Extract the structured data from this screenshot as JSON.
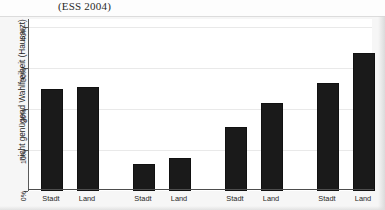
{
  "caption": {
    "text": "(ESS 2004)"
  },
  "chart_data": {
    "type": "bar",
    "title": "(ESS 2004)",
    "xlabel": "",
    "ylabel": "nicht genügend Wahlfreiheit (Hausarzt)",
    "categories": [
      "Stadt",
      "Land",
      "Stadt",
      "Land",
      "Stadt",
      "Land",
      "Stadt",
      "Land"
    ],
    "values": [
      24.8,
      25.4,
      6.6,
      8.0,
      15.6,
      21.4,
      26.3,
      33.8
    ],
    "ylim": [
      0,
      42
    ],
    "ytick_values": [
      0,
      10,
      20,
      30,
      40
    ],
    "ytick_labels": [
      "0%",
      "10%",
      "20%",
      "30%",
      "40%"
    ],
    "grid": true,
    "legend": "none",
    "bar_color": "#1a1a1a",
    "groups": 4,
    "bars_per_group": 2
  },
  "axis": {
    "y_title": "nicht genügend Wahlfreiheit (Hausarzt)",
    "ticks": [
      {
        "label": "40%",
        "value": 40
      },
      {
        "label": "30%",
        "value": 30
      },
      {
        "label": "20%",
        "value": 20
      },
      {
        "label": "10%",
        "value": 10
      },
      {
        "label": "0%",
        "value": 0
      }
    ]
  },
  "bars": [
    {
      "label": "Stadt",
      "value": 24.8
    },
    {
      "label": "Land",
      "value": 25.4
    },
    {
      "label": "Stadt",
      "value": 6.6
    },
    {
      "label": "Land",
      "value": 8.0
    },
    {
      "label": "Stadt",
      "value": 15.6
    },
    {
      "label": "Land",
      "value": 21.4
    },
    {
      "label": "Stadt",
      "value": 26.3
    },
    {
      "label": "Land",
      "value": 33.8
    }
  ]
}
